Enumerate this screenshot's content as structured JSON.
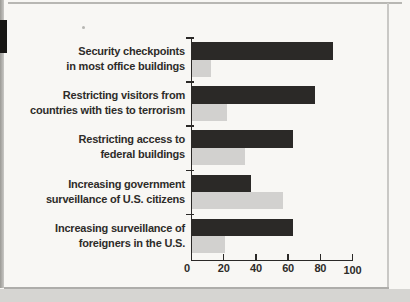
{
  "theme": {
    "page_bg": "#f8f7f4",
    "outer_bg": "#d6d5d2",
    "text_color": "#2e2c29",
    "axis_color": "#2b2927",
    "bar_black": "#2b2927",
    "bar_gray": "#d2d1cf",
    "edge_tab": "#171614",
    "edge_strip": "#9b9a95",
    "edge_strip_light": "#c9c8c5",
    "border_gray": "#aeadaa",
    "line_top": "#a3a29d"
  },
  "chart_data": {
    "type": "bar",
    "orientation": "horizontal",
    "title": "",
    "xlabel": "",
    "ylabel": "",
    "grid": false,
    "legend": "none",
    "xlim": [
      0,
      100
    ],
    "x_ticks": [
      0,
      20,
      40,
      60,
      80,
      100
    ],
    "categories": [
      "Security checkpoints\nin most office buildings",
      "Restricting visitors from\ncountries with ties to terrorism",
      "Restricting access to\nfederal buildings",
      "Increasing government\nsurveillance of U.S. citizens",
      "Increasing surveillance of\nforeigners in the U.S."
    ],
    "series": [
      {
        "name": "black-bars",
        "color": "#2b2927",
        "values": [
          88,
          77,
          63,
          37,
          63
        ]
      },
      {
        "name": "gray-bars",
        "color": "#d2d1cf",
        "values": [
          12,
          22,
          33,
          57,
          21
        ]
      }
    ]
  }
}
